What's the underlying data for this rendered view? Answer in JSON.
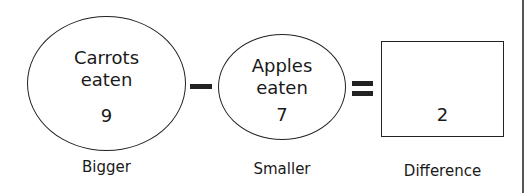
{
  "diagram": {
    "type": "subtraction-model",
    "bigger": {
      "label_line1": "Carrots",
      "label_line2": "eaten",
      "value": "9",
      "caption": "Bigger"
    },
    "operator_minus": "−",
    "smaller": {
      "label_line1": "Apples",
      "label_line2": "eaten",
      "value": "7",
      "caption": "Smaller"
    },
    "operator_equals": "=",
    "difference": {
      "value": "2",
      "caption": "Difference"
    }
  }
}
